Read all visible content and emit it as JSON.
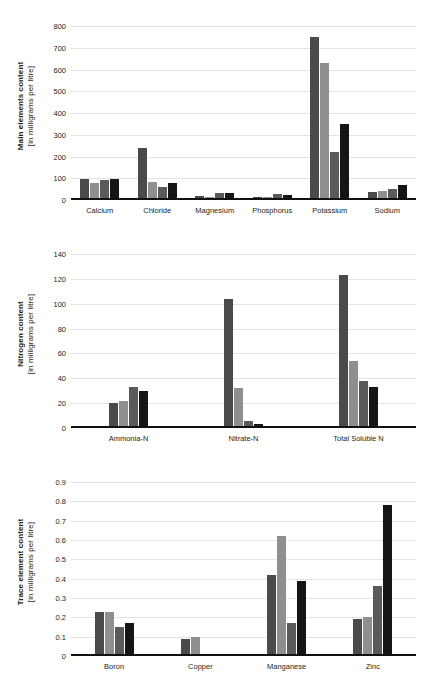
{
  "figure": {
    "background": "#ffffff",
    "series_colors": [
      "#4a4a4a",
      "#8f8f8f",
      "#5a5a5a",
      "#151515"
    ]
  },
  "chart_data": [
    {
      "type": "bar",
      "title": "",
      "xlabel": "",
      "ylabel": "Main elements content [in milligrams per litre]",
      "ylabel_line1": "Main elements content",
      "ylabel_line2": "[in milligrams per litre]",
      "categories": [
        "Calcium",
        "Chloride",
        "Magnesium",
        "Phosphorus",
        "Potassium",
        "Sodium"
      ],
      "ticks": [
        "0",
        "100",
        "200",
        "300",
        "400",
        "500",
        "600",
        "700",
        "800"
      ],
      "ylim": [
        0,
        800
      ],
      "grid": true,
      "legend": "none",
      "series": [
        {
          "name": "Series 1",
          "color": "#4a4a4a",
          "values": [
            96,
            240,
            19,
            14,
            750,
            37
          ]
        },
        {
          "name": "Series 2",
          "color": "#8f8f8f",
          "values": [
            80,
            83,
            12,
            12,
            630,
            43
          ]
        },
        {
          "name": "Series 3",
          "color": "#5a5a5a",
          "values": [
            91,
            62,
            31,
            27,
            222,
            52
          ]
        },
        {
          "name": "Series 4",
          "color": "#151515",
          "values": [
            97,
            76,
            32,
            21,
            348,
            70
          ]
        }
      ]
    },
    {
      "type": "bar",
      "title": "",
      "xlabel": "",
      "ylabel": "Nitrogen content [in milligrams per litre]",
      "ylabel_line1": "Nitrogen content",
      "ylabel_line2": "[in milligrams per litre]",
      "categories": [
        "Ammonia-N",
        "Nitrate-N",
        "Total Soluble N"
      ],
      "ticks": [
        "0",
        "20",
        "40",
        "60",
        "80",
        "100",
        "120",
        "140"
      ],
      "ylim": [
        0,
        140
      ],
      "grid": true,
      "legend": "none",
      "series": [
        {
          "name": "Series 1",
          "color": "#4a4a4a",
          "values": [
            20,
            104,
            123
          ]
        },
        {
          "name": "Series 2",
          "color": "#8f8f8f",
          "values": [
            22,
            32.5,
            54
          ]
        },
        {
          "name": "Series 3",
          "color": "#5a5a5a",
          "values": [
            33,
            6,
            37.5
          ]
        },
        {
          "name": "Series 4",
          "color": "#151515",
          "values": [
            30,
            3.5,
            33
          ]
        }
      ]
    },
    {
      "type": "bar",
      "title": "",
      "xlabel": "",
      "ylabel": "Trace element content [in milligrams per litre]",
      "ylabel_line1": "Trace element content",
      "ylabel_line2": "[in milligrams per litre]",
      "categories": [
        "Boron",
        "Copper",
        "Manganese",
        "Zinc"
      ],
      "ticks": [
        "0",
        "0.1",
        "0.2",
        "0.3",
        "0.4",
        "0.5",
        "0.6",
        "0.7",
        "0.8",
        "0.9"
      ],
      "ylim": [
        0,
        0.9
      ],
      "grid": true,
      "legend": "none",
      "series": [
        {
          "name": "Series 1",
          "color": "#4a4a4a",
          "values": [
            0.23,
            0.09,
            0.42,
            0.19
          ]
        },
        {
          "name": "Series 2",
          "color": "#8f8f8f",
          "values": [
            0.23,
            0.1,
            0.62,
            0.2
          ]
        },
        {
          "name": "Series 3",
          "color": "#5a5a5a",
          "values": [
            0.15,
            0,
            0.17,
            0.36
          ]
        },
        {
          "name": "Series 4",
          "color": "#151515",
          "values": [
            0.17,
            0,
            0.39,
            0.78
          ]
        }
      ]
    }
  ]
}
